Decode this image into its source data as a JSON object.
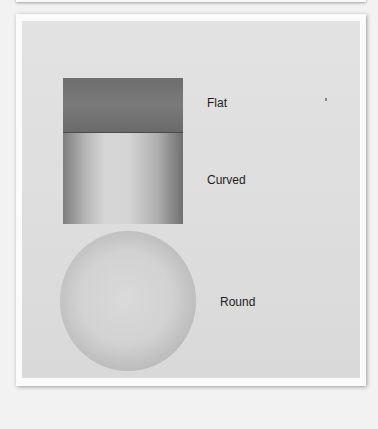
{
  "figure": {
    "shapes": [
      {
        "name": "flat-rectangle",
        "label": "Flat"
      },
      {
        "name": "curved-cylinder",
        "label": "Curved"
      },
      {
        "name": "round-sphere",
        "label": "Round"
      }
    ],
    "colors": {
      "background": "#f2f2f2",
      "paper": "#dedede",
      "flat_tone": "#707070",
      "frame": "#fbfbfb"
    }
  }
}
